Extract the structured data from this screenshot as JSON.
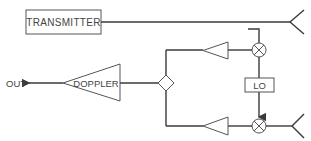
{
  "diagram": {
    "title": "",
    "blocks": {
      "transmitter": {
        "label": "TRANSMITTER"
      },
      "doppler": {
        "label": "DOPPLER"
      },
      "lo": {
        "label": "LO"
      },
      "out": {
        "label": "OUT"
      }
    },
    "components": [
      {
        "id": "transmitter",
        "type": "box",
        "label": "TRANSMITTER"
      },
      {
        "id": "tx-antenna",
        "type": "antenna"
      },
      {
        "id": "top-mixer",
        "type": "mixer"
      },
      {
        "id": "top-amp",
        "type": "amplifier"
      },
      {
        "id": "lo",
        "type": "box",
        "label": "LO"
      },
      {
        "id": "bottom-mixer",
        "type": "mixer"
      },
      {
        "id": "bottom-amp",
        "type": "amplifier"
      },
      {
        "id": "rx-antenna",
        "type": "antenna"
      },
      {
        "id": "combiner",
        "type": "diamond"
      },
      {
        "id": "doppler",
        "type": "amplifier",
        "label": "DOPPLER"
      },
      {
        "id": "out",
        "type": "output",
        "label": "OUT"
      }
    ],
    "connections": [
      [
        "transmitter",
        "tx-antenna"
      ],
      [
        "top-mixer",
        "top-amp"
      ],
      [
        "top-amp",
        "combiner"
      ],
      [
        "lo",
        "top-mixer"
      ],
      [
        "lo",
        "bottom-mixer"
      ],
      [
        "rx-antenna",
        "bottom-mixer"
      ],
      [
        "bottom-mixer",
        "bottom-amp"
      ],
      [
        "bottom-amp",
        "combiner"
      ],
      [
        "combiner",
        "doppler"
      ],
      [
        "doppler",
        "out"
      ]
    ],
    "colors": {
      "line": "#3a3a3a",
      "background": "#ffffff"
    }
  }
}
